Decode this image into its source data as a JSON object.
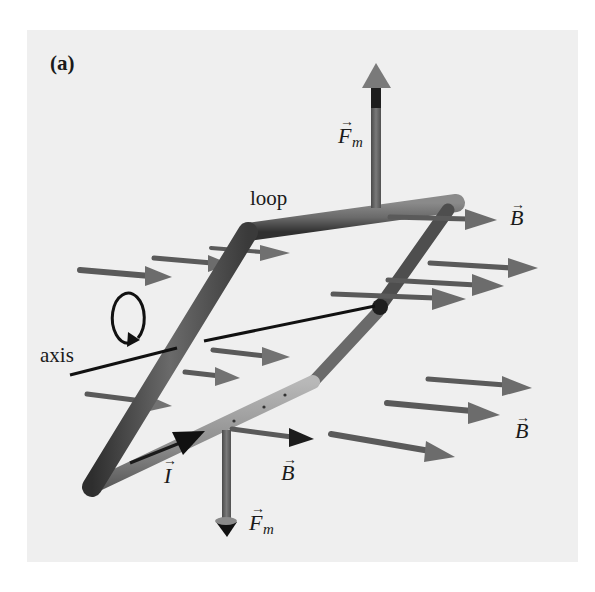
{
  "figure": {
    "panel_label": "(a)",
    "background_color": "#efefef",
    "labels": {
      "loop": "loop",
      "axis": "axis",
      "force_top": {
        "symbol": "F",
        "subscript": "m"
      },
      "force_bottom": {
        "symbol": "F",
        "subscript": "m"
      },
      "current": {
        "symbol": "I"
      },
      "field_top_right": {
        "symbol": "B"
      },
      "field_right": {
        "symbol": "B"
      },
      "field_bottom": {
        "symbol": "B"
      },
      "vector_accent": "→"
    },
    "colors": {
      "wire_dark": "#3c3c3c",
      "wire_mid": "#6a6a6a",
      "wire_light": "#9a9a9a",
      "arrow_gray": "#5c5c5c",
      "arrow_head": "#777777",
      "axis_line": "#111111",
      "text": "#1a1a1a"
    },
    "elements": {
      "loop_description": "Rectangular current loop in perspective, rotating about a horizontal axis",
      "field_arrows_count": 14,
      "force_arrows_count": 2,
      "current_arrow_count": 1,
      "rotation_indicator": "circular arrow around axis"
    }
  }
}
